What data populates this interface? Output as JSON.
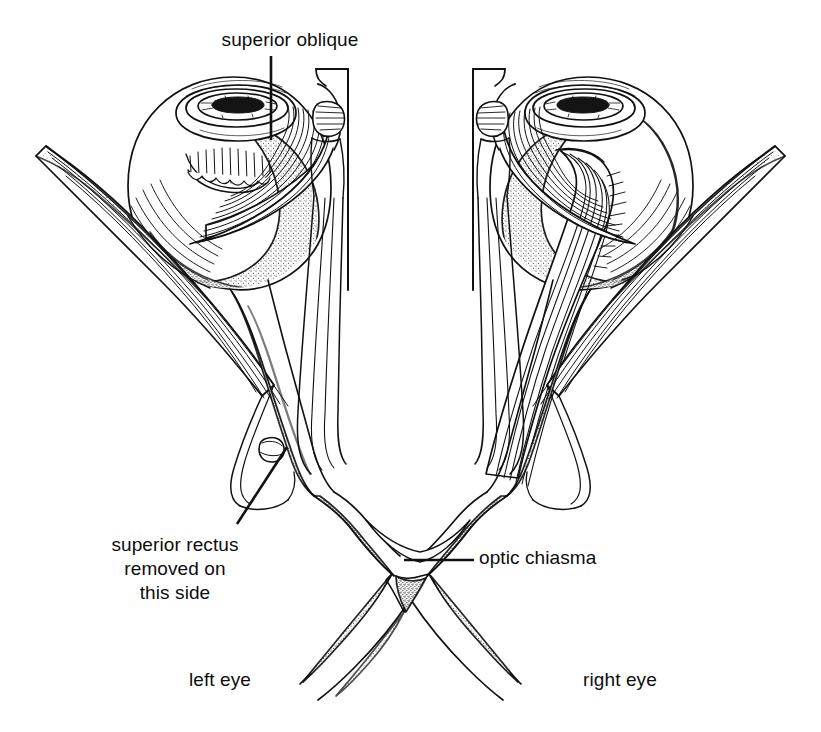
{
  "figure": {
    "background_color": "#ffffff",
    "ink_color": "#111111",
    "width": 821,
    "height": 732
  },
  "labels": {
    "superior_oblique": "superior oblique",
    "superior_rectus": "superior rectus\nremoved on\nthis side",
    "optic_chiasma": "optic chiasma",
    "left_eye": "left eye",
    "right_eye": "right eye"
  },
  "leaders": {
    "superior_oblique": {
      "type": "vertical",
      "from": [
        271,
        56
      ],
      "to": [
        271,
        140
      ]
    },
    "superior_rectus": {
      "type": "diagonal",
      "from": [
        237,
        524
      ],
      "to": [
        287,
        447
      ]
    },
    "optic_chiasma": {
      "type": "horizontal",
      "from": [
        404,
        560
      ],
      "to": [
        474,
        560
      ]
    }
  },
  "structures": [
    {
      "name": "left-eyeball",
      "side": "left",
      "label": "left eye globe"
    },
    {
      "name": "right-eyeball",
      "side": "right",
      "label": "right eye globe"
    },
    {
      "name": "left-cornea-iris",
      "side": "left",
      "label": "cornea and iris"
    },
    {
      "name": "right-cornea-iris",
      "side": "right",
      "label": "cornea and iris"
    },
    {
      "name": "left-superior-oblique",
      "side": "left",
      "label": "superior oblique muscle"
    },
    {
      "name": "right-superior-oblique",
      "side": "right",
      "label": "superior oblique muscle"
    },
    {
      "name": "left-trochlea",
      "side": "left",
      "label": "trochlea"
    },
    {
      "name": "right-trochlea",
      "side": "right",
      "label": "trochlea"
    },
    {
      "name": "left-lateral-rectus",
      "side": "left",
      "label": "lateral rectus muscle"
    },
    {
      "name": "right-lateral-rectus",
      "side": "right",
      "label": "lateral rectus muscle"
    },
    {
      "name": "left-medial-rectus",
      "side": "left",
      "label": "medial rectus muscle"
    },
    {
      "name": "right-medial-rectus",
      "side": "right",
      "label": "medial rectus muscle"
    },
    {
      "name": "right-superior-rectus",
      "side": "right",
      "label": "superior rectus muscle (intact)"
    },
    {
      "name": "left-superior-rectus-stump",
      "side": "left",
      "label": "cut stump of superior rectus"
    },
    {
      "name": "left-optic-nerve",
      "side": "left",
      "label": "optic nerve"
    },
    {
      "name": "right-optic-nerve",
      "side": "right",
      "label": "optic nerve"
    },
    {
      "name": "optic-chiasma",
      "side": "midline",
      "label": "optic chiasma"
    },
    {
      "name": "left-optic-tract",
      "side": "left",
      "label": "optic tract"
    },
    {
      "name": "right-optic-tract",
      "side": "right",
      "label": "optic tract"
    }
  ]
}
